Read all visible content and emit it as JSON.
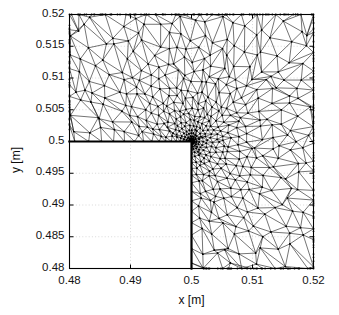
{
  "figure": {
    "kind": "finite-element-mesh-plot",
    "background_color": "#ffffff",
    "foreground_color": "#000000",
    "grid_color": "#c8c8c8"
  },
  "chart_data": {
    "type": "scatter",
    "render": "triangular-mesh",
    "title": "",
    "xlabel": "x [m]",
    "ylabel": "y [m]",
    "xlim": [
      0.48,
      0.52
    ],
    "ylim": [
      0.48,
      0.52
    ],
    "xticks": [
      0.48,
      0.49,
      0.5,
      0.51,
      0.52
    ],
    "yticks": [
      0.48,
      0.485,
      0.49,
      0.495,
      0.5,
      0.505,
      0.51,
      0.515,
      0.52
    ],
    "xticklabels": [
      "0.48",
      "0.49",
      "0.5",
      "0.51",
      "0.52"
    ],
    "yticklabels": [
      "0.48",
      "0.485",
      "0.49",
      "0.495",
      "0.5",
      "0.505",
      "0.51",
      "0.515",
      "0.52"
    ],
    "grid": true,
    "grid_style": "dotted",
    "legend": null,
    "domain": {
      "shape": "L-shaped",
      "outer_rect": [
        0.48,
        0.48,
        0.52,
        0.52
      ],
      "void_rect": [
        0.48,
        0.48,
        0.5,
        0.5
      ],
      "reentrant_corner": [
        0.5,
        0.5
      ]
    },
    "mesh": {
      "element_type": "triangle",
      "refinement": "graded-toward-reentrant-corner",
      "corner_x": 0.5,
      "corner_y": 0.5,
      "grading_exponent": 2.35,
      "radial_levels": 26,
      "base_divisions": 15,
      "line_color": "#000000",
      "line_width": 0.55,
      "node_color": "#000000",
      "node_radius": 0.9,
      "boundary_line_width": 2.2,
      "seed": 20240517
    }
  },
  "axis_titles": {
    "x": "x [m]",
    "y": "y [m]"
  }
}
